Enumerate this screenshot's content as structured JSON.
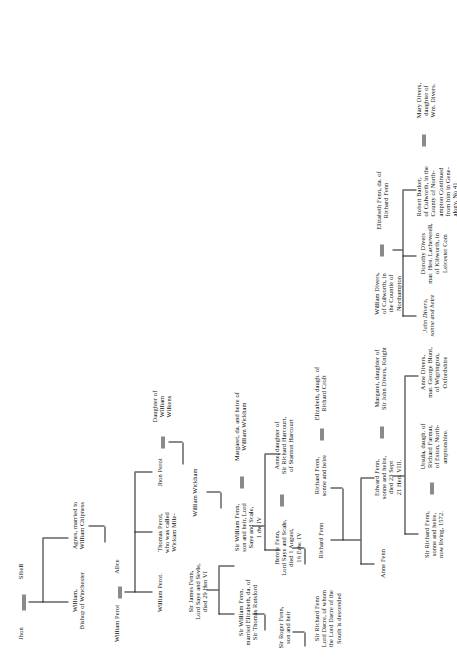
{
  "document": {
    "type": "genealogical-pedigree-chart",
    "family": "Fenn",
    "orientation": "landscape-printed-sideways",
    "ink_color": "#161616",
    "page_color": "#ffffff"
  },
  "marriage_symbol": "=",
  "generations": [
    {
      "id": "g1",
      "persons": [
        {
          "id": "jhon",
          "name": "Jhon"
        },
        {
          "id": "sibell",
          "name": "Sibell"
        }
      ]
    },
    {
      "id": "g2",
      "persons": [
        {
          "id": "william-bishop",
          "name": "William,\nBishop of Winchester"
        },
        {
          "id": "agnes",
          "name": "Agnes, married to\nWilliam Chipness"
        }
      ]
    },
    {
      "id": "g3",
      "persons": [
        {
          "id": "william-perot-1",
          "name": "William Perot"
        },
        {
          "id": "alice",
          "name": "Alice"
        }
      ]
    },
    {
      "id": "g4",
      "persons": [
        {
          "id": "william-perot-2",
          "name": "William Perot."
        },
        {
          "id": "thomas-perot",
          "name": "Thomas Perot,\nwho was called\nWickam Mile-"
        },
        {
          "id": "jhon-perot",
          "name": "Jhon Perot"
        },
        {
          "id": "daughter-wilkins",
          "name": "Daughter of\nWilliam\nWilkens"
        }
      ]
    },
    {
      "id": "g5",
      "persons": [
        {
          "id": "sir-james-fenn",
          "name": "Sir James Fenn,\nLord Saye and Sevle,\ndied 29 Hen VI"
        },
        {
          "id": "william-wickham",
          "name": "William Wickham"
        }
      ]
    },
    {
      "id": "g6",
      "persons": [
        {
          "id": "sir-william-fenn",
          "name": "Sir William Fenn,\nmarried Elizabeth, da. of\nSir Thomas Rutsford"
        },
        {
          "id": "sir-william-fenn-son",
          "name": "Sir William Fenn,\nson and heir, Lord\nSaye and Scale,\n1 dw IV"
        },
        {
          "id": "margaret-wickham",
          "name": "Margaret, da. and heire of\nWilliam Wickham"
        }
      ]
    },
    {
      "id": "g7",
      "persons": [
        {
          "id": "sir-roger-fenn",
          "name": "Sir Roger Fenn,\nson and heir"
        },
        {
          "id": "henrie-fenn",
          "name": "Henrie Fenn,\nLord Saye and Scale,\ndied 1 August,\n16 Edw. IV"
        },
        {
          "id": "anne-harcourt",
          "name": "Anne, daughter of\nSir Richard Harcourt,\nof Stanton Harcourt"
        }
      ]
    },
    {
      "id": "g8",
      "persons": [
        {
          "id": "sir-richard-fenn",
          "name": "Sir Richard Fenn\nLord Dacre, of whom\nthe Lord Dacre of the\nSouth is descended"
        },
        {
          "id": "richard-fenn-1",
          "name": "Richard Fenn"
        },
        {
          "id": "richard-fenn-heire",
          "name": "Richard Fenn,\nsonne and heire"
        },
        {
          "id": "elizabeth-croft",
          "name": "Elizabeth, daugh. of\nRichard Croft"
        }
      ]
    },
    {
      "id": "g9",
      "persons": [
        {
          "id": "anne-fenn",
          "name": "Anne Fenn"
        },
        {
          "id": "edward-fenn",
          "name": "Edward Fenn,\nsonne and heire,\ndied 23 Sept\n21 Hen. VIII."
        },
        {
          "id": "margaret-divers",
          "name": "Margaret, daughter of\nSir John Divers, Knight"
        },
        {
          "id": "william-divers",
          "name": "William Divers,\nof Culworth, in\nthe Countie of\nNorthampton"
        },
        {
          "id": "elizabeth-fenn",
          "name": "Elizabeth Fenn, da. of\nRichard Fenn"
        }
      ]
    },
    {
      "id": "g10",
      "persons": [
        {
          "id": "sir-richard-fenn-living",
          "name": "Sir Richard Fenn,\nsonne and heire,\nnow living, 1572."
        },
        {
          "id": "ursula-farmar",
          "name": "Ursula, daugh. of\nRichard Farmar,\nof Eston, North-\namptonshire."
        },
        {
          "id": "anne-divers",
          "name": "Anne Divers,\nmar. George Blunt,\nof Wigrington,\nOxfordshire"
        },
        {
          "id": "john-divers",
          "name": "John Divers,\nsonne and heire"
        },
        {
          "id": "dorothy-divers",
          "name": "Dorothy Divers\nmar. Hen. Lacheverell,\nof Kibworth, in\nLeicester Com"
        },
        {
          "id": "robert-barker",
          "name": "Robert Barker,\nof Culworth, in the\nCounty of North-\nampton  Continued\nfrom him in Gene-\nalogy, No 41"
        },
        {
          "id": "mary-divers",
          "name": "Mary Divers,\ndaughter of\nWm. Divers."
        }
      ]
    }
  ]
}
